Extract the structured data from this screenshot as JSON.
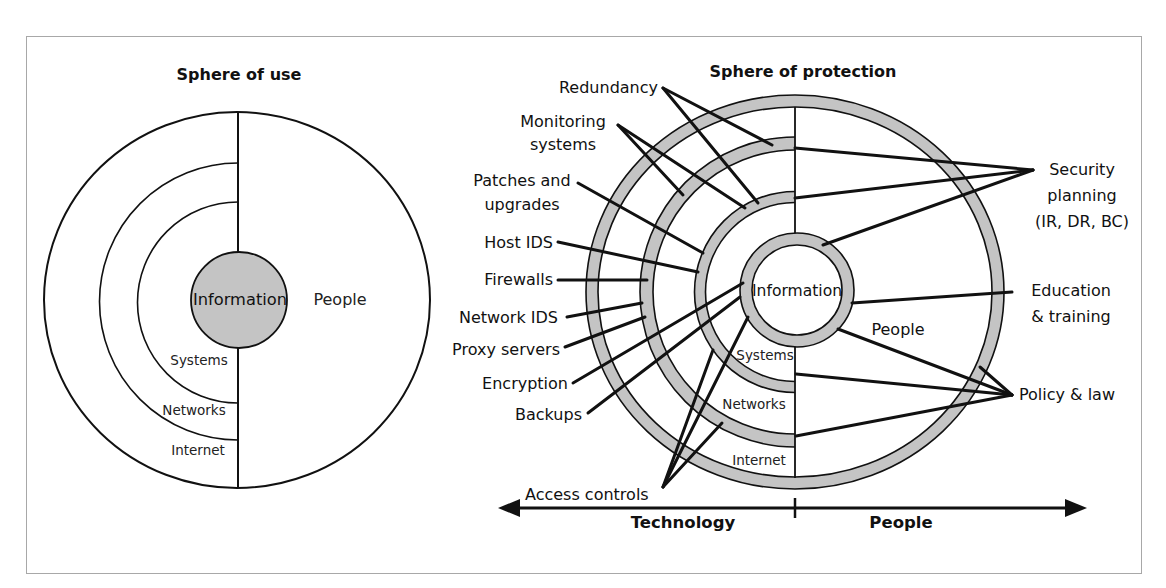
{
  "colors": {
    "band_fill": "#c4c4c4",
    "line": "#111111",
    "frame": "#a8a8a8",
    "background": "#ffffff"
  },
  "sphere_of_use": {
    "title": "Sphere of use",
    "core": "Information",
    "people": "People",
    "layers": [
      "Systems",
      "Networks",
      "Internet"
    ]
  },
  "sphere_of_protection": {
    "title": "Sphere of protection",
    "core": "Information",
    "people": "People",
    "layers": [
      "Systems",
      "Networks",
      "Internet"
    ],
    "technology_controls": [
      {
        "label_lines": [
          "Redundancy"
        ]
      },
      {
        "label_lines": [
          "Monitoring",
          "systems"
        ]
      },
      {
        "label_lines": [
          "Patches and",
          "upgrades"
        ]
      },
      {
        "label_lines": [
          "Host IDS"
        ]
      },
      {
        "label_lines": [
          "Firewalls"
        ]
      },
      {
        "label_lines": [
          "Network IDS"
        ]
      },
      {
        "label_lines": [
          "Proxy servers"
        ]
      },
      {
        "label_lines": [
          "Encryption"
        ]
      },
      {
        "label_lines": [
          "Backups"
        ]
      },
      {
        "label_lines": [
          "Access controls"
        ]
      }
    ],
    "people_controls": [
      {
        "label_lines": [
          "Security",
          "planning",
          "(IR, DR, BC)"
        ]
      },
      {
        "label_lines": [
          "Education",
          "& training"
        ]
      },
      {
        "label_lines": [
          "Policy & law"
        ]
      }
    ]
  },
  "axis": {
    "left_label": "Technology",
    "right_label": "People"
  }
}
